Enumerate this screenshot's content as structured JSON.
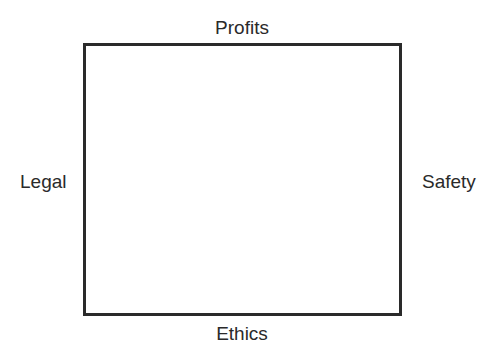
{
  "diagram": {
    "type": "box-with-side-labels",
    "labels": {
      "top": "Profits",
      "bottom": "Ethics",
      "left": "Legal",
      "right": "Safety"
    },
    "colors": {
      "stroke": "#2a2a2a",
      "text": "#2a2a2a",
      "background": "#ffffff"
    }
  }
}
